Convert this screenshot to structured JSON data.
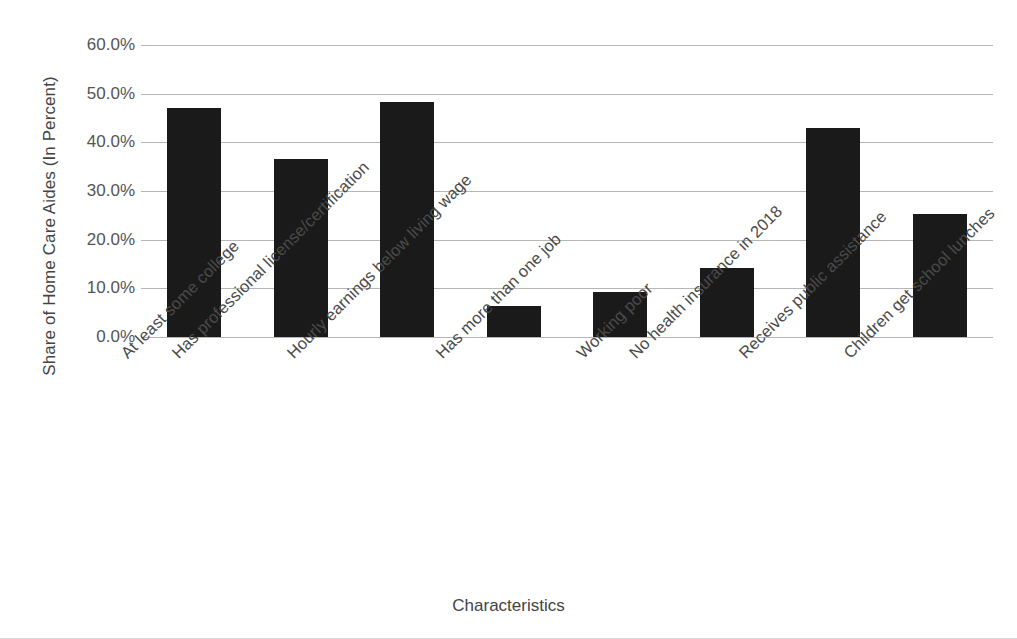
{
  "chart_data": {
    "type": "bar",
    "title": "",
    "xlabel": "Characteristics",
    "ylabel": "Share of Home Care Aides (In Percent)",
    "categories": [
      "At least some college",
      "Has professional license/certification",
      "Hourly earnings below living wage",
      "Has more than one job",
      "Working poor",
      "No health insurance in 2018",
      "Receives public assistance",
      "Children get school lunches"
    ],
    "values": [
      47.0,
      36.6,
      48.3,
      6.4,
      9.2,
      14.2,
      42.9,
      25.2
    ],
    "ylim": [
      0,
      60
    ],
    "ytick_values": [
      0,
      10,
      20,
      30,
      40,
      50,
      60
    ],
    "ytick_labels": [
      "0.0%",
      "10.0%",
      "20.0%",
      "30.0%",
      "40.0%",
      "50.0%",
      "60.0%"
    ],
    "grid": true,
    "legend": false,
    "bar_color": "#1a1a1a",
    "gridline_color": "#b6b6b6",
    "background_color": "#ffffff",
    "x_label_rotation": -45
  }
}
